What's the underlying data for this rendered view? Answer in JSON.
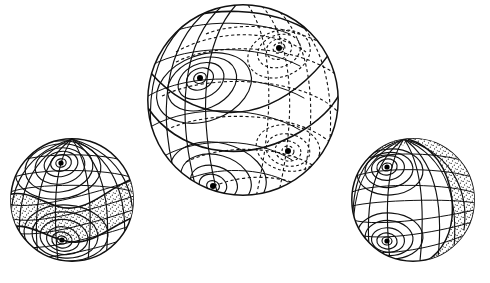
{
  "figure": {
    "background_color": "#ffffff",
    "line_color": "#111111",
    "stipple_color": "#111111",
    "canvas": {
      "width": 490,
      "height": 283
    },
    "style_notes": {
      "visible_lines": "solid",
      "hidden_lines": "dashed",
      "shaded_regions": "stipple dot texture"
    }
  },
  "spheres": [
    {
      "id": "left",
      "label": "left-sphere",
      "center": {
        "x": 72,
        "y": 200
      },
      "radius": 62,
      "focus_count": 2,
      "foci": [
        {
          "name": "upper-focus",
          "x": 61,
          "y": 163,
          "type": "center",
          "rings": 5
        },
        {
          "name": "lower-focus",
          "x": 62,
          "y": 240,
          "type": "center",
          "rings": 5
        }
      ],
      "shaded_band": "wavy equatorial band, stippled",
      "hidden_lines": false
    },
    {
      "id": "center",
      "label": "center-sphere",
      "center": {
        "x": 243,
        "y": 100
      },
      "radius": 96,
      "focus_count": 4,
      "foci": [
        {
          "name": "front-upper-focus",
          "x": 200,
          "y": 78,
          "type": "center",
          "rings": 4,
          "hidden": false
        },
        {
          "name": "front-lower-focus",
          "x": 213,
          "y": 186,
          "type": "center",
          "rings": 4,
          "hidden": false
        },
        {
          "name": "back-upper-focus",
          "x": 279,
          "y": 48,
          "type": "center",
          "rings": 3,
          "hidden": true
        },
        {
          "name": "back-lower-focus",
          "x": 288,
          "y": 151,
          "type": "center",
          "rings": 3,
          "hidden": true
        }
      ],
      "shaded_band": "none",
      "hidden_lines": true,
      "separatrix": "S-shaped diagonal great curve from upper-left to lower-right"
    },
    {
      "id": "right",
      "label": "right-sphere",
      "center": {
        "x": 413,
        "y": 200
      },
      "radius": 62,
      "focus_count": 2,
      "foci": [
        {
          "name": "upper-focus",
          "x": 387,
          "y": 167,
          "type": "center",
          "rings": 5
        },
        {
          "name": "lower-focus",
          "x": 387,
          "y": 241,
          "type": "center",
          "rings": 5
        }
      ],
      "shaded_band": "vertical lune on right limb plus thin cap band, stippled",
      "hidden_lines": false
    }
  ]
}
